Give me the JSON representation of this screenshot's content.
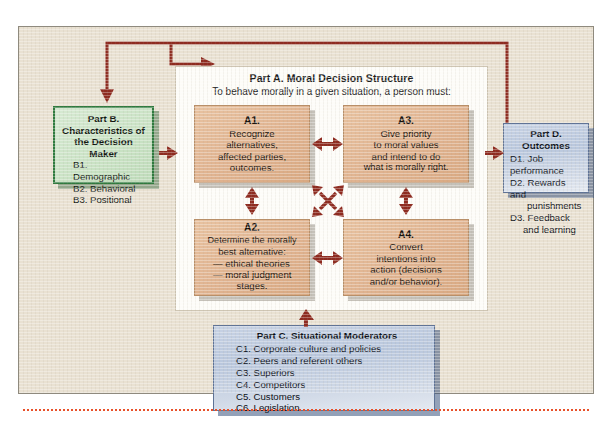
{
  "diagram": {
    "title_row_clipped": "",
    "part_a": {
      "heading": "Part A. Moral Decision Structure",
      "subheading": "To behave morally in a given situation, a person must:",
      "boxes": [
        {
          "id": "A1",
          "label": "A1.",
          "lines": [
            "Recognize",
            "alternatives,",
            "affected parties,",
            "outcomes."
          ]
        },
        {
          "id": "A3",
          "label": "A3.",
          "lines": [
            "Give priority",
            "to moral values",
            "and intend to do",
            "what is morally right."
          ]
        },
        {
          "id": "A2",
          "label": "A2.",
          "lines": [
            "Determine the morally",
            "best alternative:",
            "— ethical theories",
            "— moral judgment",
            "stages."
          ]
        },
        {
          "id": "A4",
          "label": "A4.",
          "lines": [
            "Convert",
            "intentions into",
            "action (decisions",
            "and/or behavior)."
          ]
        }
      ]
    },
    "part_b": {
      "heading_line1": "Part B.",
      "heading_line2": "Characteristics of",
      "heading_line3": "the Decision Maker",
      "items": [
        "B1. Demographic",
        "B2. Behavioral",
        "B3. Positional"
      ]
    },
    "part_c": {
      "heading": "Part C. Situational Moderators",
      "items": [
        "C1. Corporate culture and policies",
        "C2. Peers and referent others",
        "C3. Superiors",
        "C4. Competitors",
        "C5. Customers",
        "C6. Legislation"
      ]
    },
    "part_d": {
      "heading": "Part D. Outcomes",
      "items": [
        "D1. Job performance",
        "D2. Rewards and",
        "punishments",
        "D3. Feedback",
        "and learning"
      ]
    },
    "colors": {
      "canvas_background": "#e9e1d2",
      "panel_background": "#fdfcf8",
      "a_box_fill": "#e0b390",
      "a_box_border": "#b98f68",
      "b_box_fill": "#c9e2c4",
      "b_box_border": "#2f7a3e",
      "blue_box_fill": "#b9c7dd",
      "blue_box_border": "#5f7396",
      "arrow_color": "#8e2b20",
      "feedback_line_color": "#8e2b20",
      "dotted_rule_color": "#e8502a"
    },
    "arrows": {
      "a1_a3": "double-horizontal",
      "a2_a4": "double-horizontal",
      "a1_a2": "double-vertical",
      "a3_a4": "double-vertical",
      "diagonal_cross": "four-way-diagonal",
      "b_to_a1": "right",
      "a3_to_d": "right",
      "c_to_a4": "up",
      "d_feedback_to_b": "down",
      "d_feedback_to_a": "right"
    }
  }
}
